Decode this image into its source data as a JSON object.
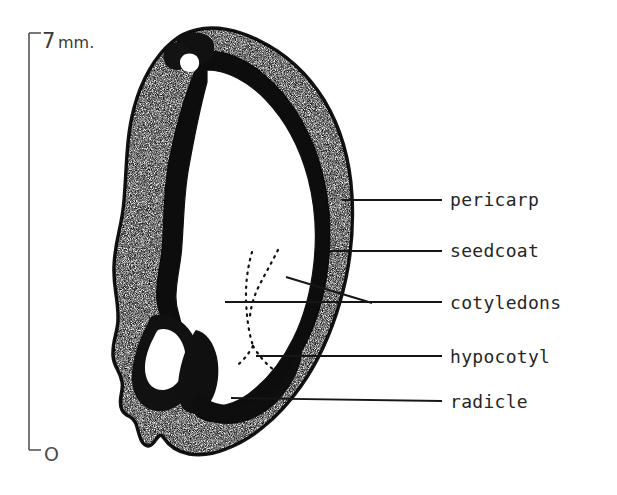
{
  "figure": {
    "background_color": "#ffffff",
    "ink_color": "#1a1a1a"
  },
  "scale_bar": {
    "name": "scale-bar",
    "top_label": "7mm.",
    "top_label_number": "7",
    "top_label_unit": "mm.",
    "bottom_label": "O",
    "orientation": "vertical",
    "axis_x": 29,
    "top_y": 33,
    "bottom_y": 450,
    "color": "#555555"
  },
  "specimen": {
    "name": "seed-longitudinal-section",
    "layers": [
      {
        "name": "pericarp",
        "style": "stippled",
        "fill": "#ffffff",
        "stipple_color": "#1c1c1c"
      },
      {
        "name": "seedcoat",
        "style": "solid-dark",
        "fill": "#101010"
      },
      {
        "name": "cotyledons",
        "style": "blank",
        "fill": "#ffffff"
      },
      {
        "name": "hypocotyl",
        "style": "dotted-outline",
        "fill": "#ffffff"
      },
      {
        "name": "radicle",
        "style": "solid-dark",
        "fill": "#101010"
      }
    ]
  },
  "callouts": [
    {
      "id": "pericarp",
      "label": "pericarp",
      "label_x": 450,
      "label_y": 205,
      "leader": {
        "x1": 342,
        "y1": 200,
        "x2": 442,
        "y2": 200
      },
      "branch": null
    },
    {
      "id": "seedcoat",
      "label": "seedcoat",
      "label_x": 450,
      "label_y": 257,
      "leader": {
        "x1": 330,
        "y1": 251,
        "x2": 442,
        "y2": 251
      },
      "branch": null
    },
    {
      "id": "cotyledons",
      "label": "cotyledons",
      "label_x": 450,
      "label_y": 305,
      "leader": {
        "x1": 225,
        "y1": 302,
        "x2": 442,
        "y2": 302
      },
      "branch": {
        "x1": 286,
        "y1": 277,
        "x2": 372,
        "y2": 303
      }
    },
    {
      "id": "hypocotyl",
      "label": "hypocotyl",
      "label_x": 450,
      "label_y": 362,
      "leader": {
        "x1": 256,
        "y1": 356,
        "x2": 442,
        "y2": 356
      },
      "branch": null
    },
    {
      "id": "radicle",
      "label": "radicle",
      "label_x": 450,
      "label_y": 406,
      "leader": {
        "x1": 231,
        "y1": 398,
        "x2": 442,
        "y2": 401
      },
      "branch": null
    }
  ]
}
